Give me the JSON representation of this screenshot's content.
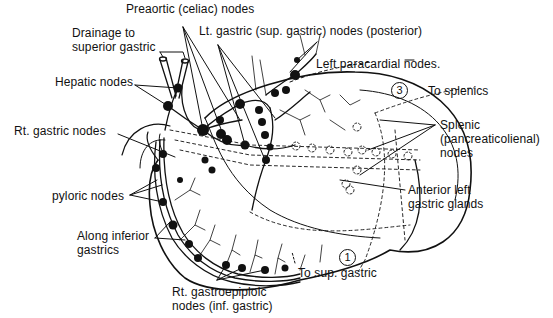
{
  "figure": {
    "labels": {
      "preaortic": "Preaortic (celiac) nodes",
      "lt_gastric": "Lt. gastric (sup. gastric) nodes (posterior)",
      "drainage_line1": "Drainage to",
      "drainage_line2": "superior gastric",
      "hepatic": "Hepatic nodes",
      "left_paracardial": "Left paracardial nodes.",
      "to_splenics": "To splenics",
      "rt_gastric": "Rt. gastric nodes",
      "splenic_line1": "Splenic",
      "splenic_line2": "(pancreaticolienal)",
      "splenic_line3": "nodes",
      "pyloric": "pyloric nodes",
      "anterior_line1": "Anterior left",
      "anterior_line2": "gastric glands",
      "inferior_line1": "Along inferior",
      "inferior_line2": "gastrics",
      "to_sup_gastric": "To sup. gastric",
      "rt_gastroepiploic_line1": "Rt. gastroepiploic",
      "rt_gastroepiploic_line2": "nodes (inf. gastric)"
    },
    "zone_markers": {
      "zone_3": "3",
      "zone_1": "1"
    },
    "colors": {
      "ink": "#111111",
      "background": "#ffffff"
    }
  }
}
